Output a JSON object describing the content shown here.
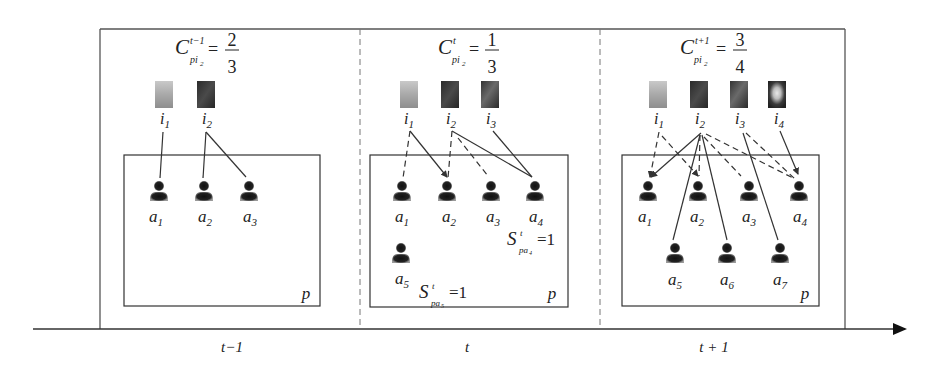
{
  "colors": {
    "line": "#333333",
    "frame": "#555555",
    "agent": "#1a1a1a",
    "background": "#ffffff"
  },
  "timeline": {
    "labels": [
      "t−1",
      "t",
      "t + 1"
    ],
    "arrow": "right"
  },
  "panels": [
    {
      "time_label": "t−1",
      "formula": {
        "symbol": "C",
        "superscript": "t−1",
        "subscript": "pi",
        "subsub": "2",
        "eq": "=",
        "numerator": "2",
        "denominator": "3"
      },
      "page_label": "p",
      "images": [
        {
          "id": "i1",
          "label": "i",
          "sub": "1",
          "tone": "light"
        },
        {
          "id": "i2",
          "label": "i",
          "sub": "2",
          "tone": "dark"
        }
      ],
      "agents": [
        {
          "id": "a1",
          "label": "a",
          "sub": "1"
        },
        {
          "id": "a2",
          "label": "a",
          "sub": "2"
        },
        {
          "id": "a3",
          "label": "a",
          "sub": "3"
        }
      ],
      "edges": [
        {
          "from": "i1",
          "to": "a1",
          "style": "solid"
        },
        {
          "from": "i2",
          "to": "a2",
          "style": "solid"
        },
        {
          "from": "i2",
          "to": "a3",
          "style": "solid"
        }
      ],
      "annotations": []
    },
    {
      "time_label": "t",
      "formula": {
        "symbol": "C",
        "superscript": "t",
        "subscript": "pi",
        "subsub": "2",
        "eq": "=",
        "numerator": "1",
        "denominator": "3"
      },
      "page_label": "p",
      "images": [
        {
          "id": "i1",
          "label": "i",
          "sub": "1",
          "tone": "light"
        },
        {
          "id": "i2",
          "label": "i",
          "sub": "2",
          "tone": "dark"
        },
        {
          "id": "i3",
          "label": "i",
          "sub": "3",
          "tone": "dark"
        }
      ],
      "agents": [
        {
          "id": "a1",
          "label": "a",
          "sub": "1"
        },
        {
          "id": "a2",
          "label": "a",
          "sub": "2"
        },
        {
          "id": "a3",
          "label": "a",
          "sub": "3"
        },
        {
          "id": "a4",
          "label": "a",
          "sub": "4"
        },
        {
          "id": "a5",
          "label": "a",
          "sub": "5"
        }
      ],
      "edges": [
        {
          "from": "i1",
          "to": "a1",
          "style": "dashed"
        },
        {
          "from": "i1",
          "to": "a2",
          "style": "solid-arrow"
        },
        {
          "from": "i2",
          "to": "a2",
          "style": "dashed"
        },
        {
          "from": "i2",
          "to": "a3",
          "style": "dashed"
        },
        {
          "from": "i2",
          "to": "a4",
          "style": "solid"
        },
        {
          "from": "i3",
          "to": "a4",
          "style": "solid"
        }
      ],
      "annotations": [
        {
          "symbol": "S",
          "superscript": "t",
          "subscript": "pa",
          "subsub": "4",
          "eq": "=1"
        },
        {
          "symbol": "S",
          "superscript": "t",
          "subscript": "pa",
          "subsub": "5",
          "eq": "=1"
        }
      ]
    },
    {
      "time_label": "t + 1",
      "formula": {
        "symbol": "C",
        "superscript": "t+1",
        "subscript": "pi",
        "subsub": "2",
        "eq": "=",
        "numerator": "3",
        "denominator": "4"
      },
      "page_label": "p",
      "images": [
        {
          "id": "i1",
          "label": "i",
          "sub": "1",
          "tone": "light"
        },
        {
          "id": "i2",
          "label": "i",
          "sub": "2",
          "tone": "dark"
        },
        {
          "id": "i3",
          "label": "i",
          "sub": "3",
          "tone": "dark"
        },
        {
          "id": "i4",
          "label": "i",
          "sub": "4",
          "tone": "flower"
        }
      ],
      "agents": [
        {
          "id": "a1",
          "label": "a",
          "sub": "1"
        },
        {
          "id": "a2",
          "label": "a",
          "sub": "2"
        },
        {
          "id": "a3",
          "label": "a",
          "sub": "3"
        },
        {
          "id": "a4",
          "label": "a",
          "sub": "4"
        },
        {
          "id": "a5",
          "label": "a",
          "sub": "5"
        },
        {
          "id": "a6",
          "label": "a",
          "sub": "6"
        },
        {
          "id": "a7",
          "label": "a",
          "sub": "7"
        }
      ],
      "edges": [
        {
          "from": "i1",
          "to": "a1",
          "style": "dashed-arrow"
        },
        {
          "from": "i1",
          "to": "a2",
          "style": "dashed-arrow"
        },
        {
          "from": "i2",
          "to": "a1",
          "style": "solid-arrow"
        },
        {
          "from": "i2",
          "to": "a2",
          "style": "dashed"
        },
        {
          "from": "i2",
          "to": "a3",
          "style": "dashed"
        },
        {
          "from": "i2",
          "to": "a4",
          "style": "dashed"
        },
        {
          "from": "i2",
          "to": "a5",
          "style": "solid"
        },
        {
          "from": "i2",
          "to": "a6",
          "style": "solid"
        },
        {
          "from": "i3",
          "to": "a4",
          "style": "dashed"
        },
        {
          "from": "i3",
          "to": "a7",
          "style": "solid"
        },
        {
          "from": "i4",
          "to": "a4",
          "style": "solid-arrow"
        }
      ],
      "annotations": []
    }
  ]
}
